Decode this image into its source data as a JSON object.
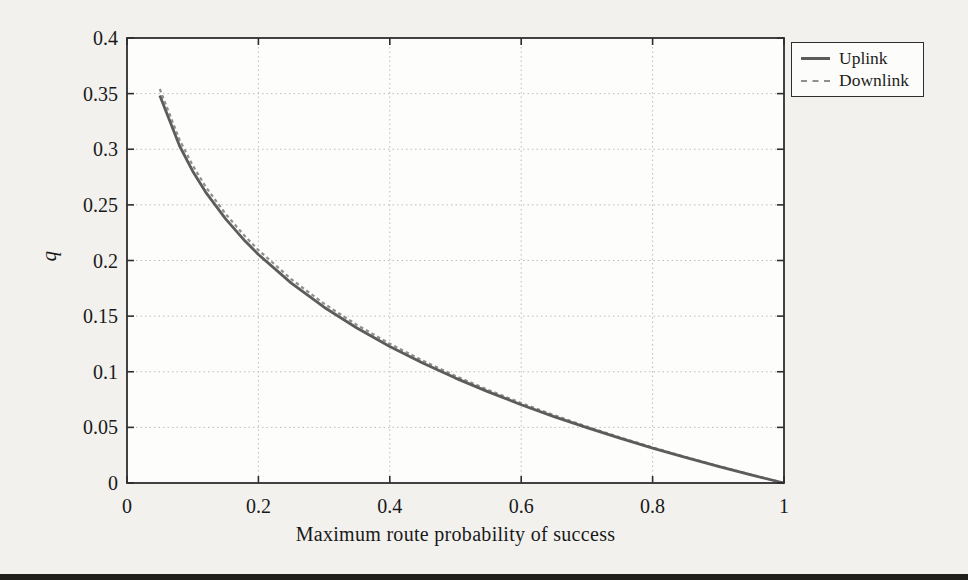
{
  "page": {
    "background": "#f2f1ee",
    "footer_bar_color": "#211f1c"
  },
  "chart_data": {
    "type": "line",
    "title": "",
    "xlabel": "Maximum route probability of success",
    "ylabel": "q",
    "xlim": [
      0,
      1
    ],
    "ylim": [
      0,
      0.4
    ],
    "xticks": [
      0,
      0.2,
      0.4,
      0.6,
      0.8,
      1
    ],
    "xticklabels": [
      "0",
      "0.2",
      "0.4",
      "0.6",
      "0.8",
      "1"
    ],
    "yticks": [
      0,
      0.05,
      0.1,
      0.15,
      0.2,
      0.25,
      0.3,
      0.35,
      0.4
    ],
    "yticklabels": [
      "0",
      "0.05",
      "0.1",
      "0.15",
      "0.2",
      "0.25",
      "0.3",
      "0.35",
      "0.4"
    ],
    "grid": "dotted",
    "grid_color": "#bcbcbc",
    "axis_color": "#2e2e2e",
    "plot_bg": "#fdfdfb",
    "legend_position": "outside-top-right",
    "series": [
      {
        "name": "Uplink",
        "style": "solid",
        "color": "#5c5c5c",
        "width": 2.8,
        "points": [
          [
            0.05,
            0.3482
          ],
          [
            0.08,
            0.3029
          ],
          [
            0.1,
            0.2803
          ],
          [
            0.12,
            0.2613
          ],
          [
            0.15,
            0.2374
          ],
          [
            0.18,
            0.2173
          ],
          [
            0.2,
            0.2054
          ],
          [
            0.25,
            0.1797
          ],
          [
            0.3,
            0.158
          ],
          [
            0.35,
            0.1393
          ],
          [
            0.4,
            0.1227
          ],
          [
            0.45,
            0.1078
          ],
          [
            0.5,
            0.0943
          ],
          [
            0.55,
            0.0819
          ],
          [
            0.6,
            0.0704
          ],
          [
            0.65,
            0.0597
          ],
          [
            0.7,
            0.0497
          ],
          [
            0.75,
            0.0403
          ],
          [
            0.8,
            0.0314
          ],
          [
            0.85,
            0.023
          ],
          [
            0.9,
            0.0149
          ],
          [
            0.95,
            0.0073
          ],
          [
            1.0,
            0.0
          ]
        ]
      },
      {
        "name": "Downlink",
        "style": "dashed",
        "color": "#8f8f8f",
        "width": 2.2,
        "points": [
          [
            0.05,
            0.3542
          ],
          [
            0.08,
            0.3084
          ],
          [
            0.1,
            0.2855
          ],
          [
            0.12,
            0.2662
          ],
          [
            0.15,
            0.2419
          ],
          [
            0.18,
            0.2215
          ],
          [
            0.2,
            0.2094
          ],
          [
            0.25,
            0.1832
          ],
          [
            0.3,
            0.1612
          ],
          [
            0.35,
            0.1421
          ],
          [
            0.4,
            0.1252
          ],
          [
            0.45,
            0.11
          ],
          [
            0.5,
            0.0962
          ],
          [
            0.55,
            0.0836
          ],
          [
            0.6,
            0.0719
          ],
          [
            0.65,
            0.061
          ],
          [
            0.7,
            0.0507
          ],
          [
            0.75,
            0.0411
          ],
          [
            0.8,
            0.032
          ],
          [
            0.85,
            0.0234
          ],
          [
            0.9,
            0.0153
          ],
          [
            0.95,
            0.0075
          ],
          [
            1.0,
            0.0
          ]
        ]
      }
    ]
  }
}
